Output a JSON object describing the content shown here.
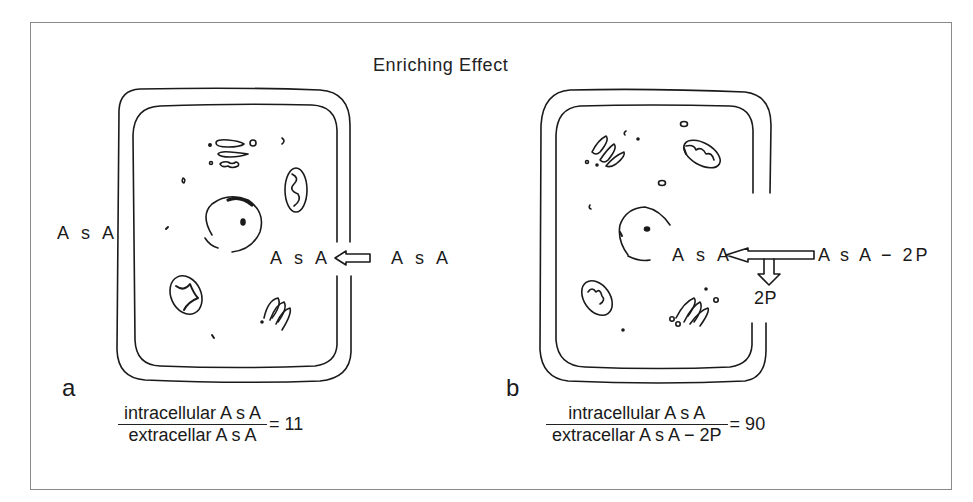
{
  "title": "Enriching Effect",
  "panel_a": {
    "label": "a",
    "outside_label": "A s A",
    "intracellular_label": "A s A",
    "extracellular_label": "A s A",
    "arrow_direction": "left",
    "fraction": {
      "numerator": "intracellular  A s A",
      "denominator": "extracellar  A s A",
      "result": "= 11"
    }
  },
  "panel_b": {
    "label": "b",
    "intracellular_label": "A s A",
    "extracellular_label": "A s A − 2P",
    "byproduct_label": "2P",
    "arrow_direction": "left",
    "byproduct_arrow_direction": "down",
    "fraction": {
      "numerator": "intracellular  A s A",
      "denominator": "extracellar  A s A − 2P",
      "result": "= 90"
    }
  },
  "colors": {
    "line": "#1a1a1a",
    "frame": "#8a8a8a",
    "background": "#ffffff"
  }
}
